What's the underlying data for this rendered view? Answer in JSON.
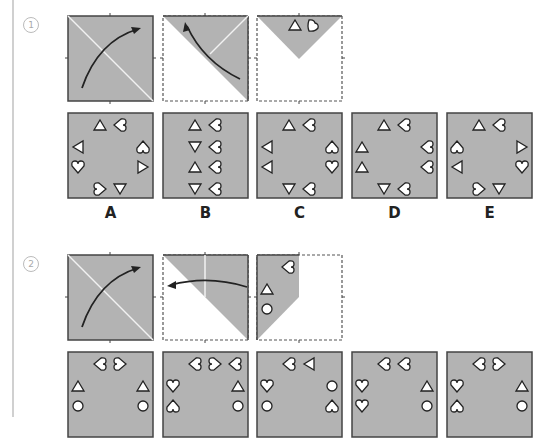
{
  "colors": {
    "paper": "#b3b3b3",
    "border": "#444444",
    "fold_line": "#f2f2f2",
    "dashed": "#555555"
  },
  "problems": [
    {
      "number": "1",
      "steps": [
        "fold diagonal from bottom-left to top-right",
        "fold toward top-left corner",
        "result: top triangle with triangle and heart"
      ],
      "options": [
        {
          "label": "A"
        },
        {
          "label": "B"
        },
        {
          "label": "C"
        },
        {
          "label": "D"
        },
        {
          "label": "E"
        }
      ]
    },
    {
      "number": "2",
      "steps": [
        "fold diagonal from bottom-left to top-right",
        "fold right side to the left",
        "result: left strip with heart, triangle, circle"
      ],
      "options": [
        {
          "label": ""
        },
        {
          "label": ""
        },
        {
          "label": ""
        },
        {
          "label": ""
        },
        {
          "label": ""
        }
      ]
    }
  ]
}
